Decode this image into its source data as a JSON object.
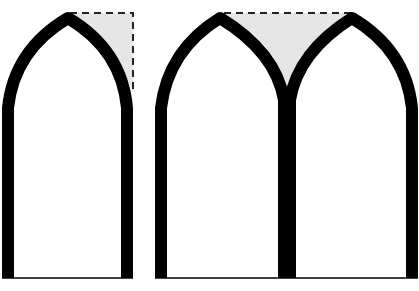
{
  "diagram": {
    "title": "",
    "colors": {
      "background": "#ffffff",
      "stroke": "#000000",
      "spandrel_fill": "#e6e6e6",
      "dash": "#222222"
    },
    "figures": [
      {
        "id": "single-arch",
        "label": "single lancet arch with spandrel",
        "shaded_region": "right spandrel triangle bounded by dashed lines"
      },
      {
        "id": "twin-arch",
        "label": "twin lancet arch with central spandrel",
        "shaded_region": "triangular spandrel between the two arches bounded by dashed top line"
      }
    ]
  }
}
